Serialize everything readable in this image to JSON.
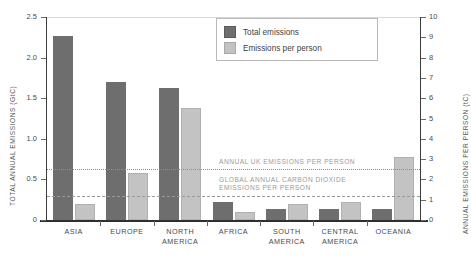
{
  "chart_data": {
    "type": "bar",
    "title": "",
    "categories": [
      "ASIA",
      "EUROPE",
      "NORTH AMERICA",
      "AFRICA",
      "SOUTH AMERICA",
      "CENTRAL AMERICA",
      "OCEANIA"
    ],
    "series": [
      {
        "name": "Total emissions",
        "axis": "left",
        "unit": "GtC",
        "color": "#6e6e6e",
        "values": [
          2.27,
          1.7,
          1.63,
          0.22,
          0.13,
          0.14,
          0.13
        ]
      },
      {
        "name": "Emissions per person",
        "axis": "right",
        "unit": "tC",
        "color": "#c3c3c3",
        "values": [
          0.8,
          2.3,
          5.5,
          0.4,
          0.8,
          0.9,
          3.1
        ]
      }
    ],
    "ylabel": "TOTAL ANNUAL EMISSIONS (GtC)",
    "ylabel_right": "ANNUAL EMISSIONS PER PERSON (tC)",
    "xlabel": "",
    "ylim": [
      0,
      2.5
    ],
    "ylim_right": [
      0,
      10
    ],
    "yticks": [
      "0",
      "0.5",
      "1.0",
      "1.5",
      "2.0",
      "2.5"
    ],
    "yticks_right": [
      "0",
      "1",
      "2",
      "3",
      "4",
      "5",
      "6",
      "7",
      "8",
      "9",
      "10"
    ],
    "grid": false,
    "legend_position": "top-right",
    "annotations": [
      {
        "name": "uk-per-person",
        "label": "ANNUAL UK EMISSIONS PER PERSON",
        "value_tC": 2.5,
        "style": "dotted"
      },
      {
        "name": "global-per-person",
        "label_line1": "GLOBAL ANNUAL CARBON DIOXIDE",
        "label_line2": "EMISSIONS PER PERSON",
        "value_tC": 1.2,
        "style": "dashed"
      }
    ]
  },
  "legend": {
    "items": [
      {
        "label": "Total emissions",
        "swatch": "dark"
      },
      {
        "label": "Emissions per person",
        "swatch": "light"
      }
    ]
  },
  "axes": {
    "left_title": "TOTAL ANNUAL EMISSIONS (GtC)",
    "right_title": "ANNUAL EMISSIONS PER PERSON (tC)"
  },
  "categories_display": [
    {
      "line1": "ASIA",
      "line2": ""
    },
    {
      "line1": "EUROPE",
      "line2": ""
    },
    {
      "line1": "NORTH",
      "line2": "AMERICA"
    },
    {
      "line1": "AFRICA",
      "line2": ""
    },
    {
      "line1": "SOUTH",
      "line2": "AMERICA"
    },
    {
      "line1": "CENTRAL",
      "line2": "AMERICA"
    },
    {
      "line1": "OCEANIA",
      "line2": ""
    }
  ]
}
